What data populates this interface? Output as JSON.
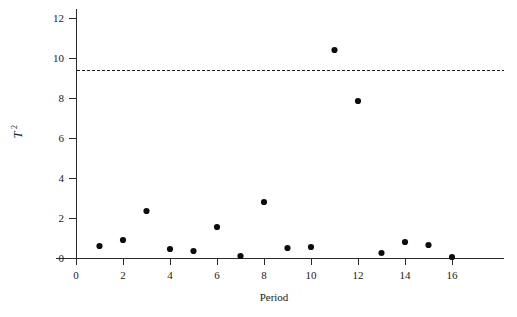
{
  "chart_data": {
    "type": "scatter",
    "title": "",
    "subtitle": "",
    "xlabel": "Period",
    "ylabel": "T²",
    "ylabel_base": "T",
    "ylabel_exponent": "2",
    "x": [
      1,
      2,
      3,
      4,
      5,
      6,
      7,
      8,
      9,
      10,
      11,
      12,
      13,
      14,
      15,
      16
    ],
    "values": [
      0.6,
      0.9,
      2.35,
      0.45,
      0.35,
      1.55,
      0.1,
      2.8,
      0.5,
      0.55,
      10.4,
      7.85,
      0.25,
      0.8,
      0.65,
      0.05
    ],
    "series": [
      {
        "name": "T-squared statistic",
        "values": [
          0.6,
          0.9,
          2.35,
          0.45,
          0.35,
          1.55,
          0.1,
          2.8,
          0.5,
          0.55,
          10.4,
          7.85,
          0.25,
          0.8,
          0.65,
          0.05
        ]
      }
    ],
    "xlim": [
      -0.85,
      18.2
    ],
    "ylim": [
      -0.35,
      12.45
    ],
    "xticks": [
      0,
      2,
      4,
      6,
      8,
      10,
      12,
      14,
      16
    ],
    "xtick_labels": [
      "0",
      "2",
      "4",
      "6",
      "8",
      "10",
      "12",
      "14",
      "16"
    ],
    "yticks": [
      0,
      2,
      4,
      6,
      8,
      10,
      12
    ],
    "ytick_labels": [
      "0",
      "2",
      "4",
      "6",
      "8",
      "10",
      "12"
    ],
    "grid": false,
    "legend": false,
    "legend_position": "none",
    "annotations": [
      {
        "name": "upper-control-limit",
        "type": "hline",
        "value": 9.4,
        "style": "dashed",
        "color": "#1a1a1a"
      }
    ],
    "marker": {
      "shape": "circle",
      "color": "#0d0d0d",
      "radius": 3.1
    },
    "colors": {
      "axis": "#2a2a2a",
      "marker": "#0d0d0d",
      "limit_line": "#1a1a1a",
      "background": "#ffffff",
      "text": "#1a1a1a"
    }
  }
}
